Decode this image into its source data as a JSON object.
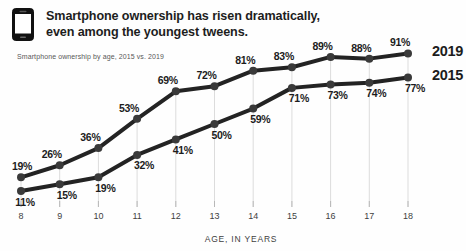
{
  "header": {
    "title_line1": "Smartphone ownership has risen dramatically,",
    "title_line2": "even among the youngest tweens.",
    "subtitle": "Smartphone ownership by age, 2015 vs. 2019"
  },
  "chart_data": {
    "type": "line",
    "x": [
      8,
      9,
      10,
      11,
      12,
      13,
      14,
      15,
      16,
      17,
      18
    ],
    "xlabel": "AGE, IN YEARS",
    "ylim": [
      0,
      100
    ],
    "grid": "vertical",
    "legend_position": "right",
    "label_suffix": "%",
    "series": [
      {
        "name": "2019",
        "values": [
          19,
          26,
          36,
          53,
          69,
          72,
          81,
          83,
          89,
          88,
          91
        ]
      },
      {
        "name": "2015",
        "values": [
          11,
          15,
          19,
          32,
          41,
          50,
          59,
          71,
          73,
          74,
          77
        ]
      }
    ]
  },
  "colors": {
    "background": "#fefefe",
    "title_text": "#1d1d1d",
    "subtitle_text": "#585858",
    "line": "#232323",
    "marker": "#3a3a3a",
    "point_label": "#1c1c1c",
    "gridline": "#dcdcdc",
    "tick": "#b8b8b8",
    "axis_text": "#3f3f3f",
    "icon": "#111111"
  }
}
